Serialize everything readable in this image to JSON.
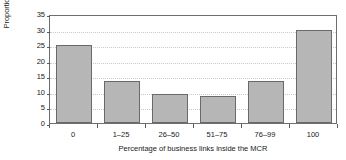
{
  "chart_data": {
    "type": "bar",
    "title": "",
    "xlabel": "Percentage of business links inside the MCR",
    "ylabel": "Proportion of sample (%)",
    "categories": [
      "0",
      "1–25",
      "26–50",
      "51–75",
      "76–99",
      "100"
    ],
    "values": [
      25,
      13.4,
      9.2,
      8.6,
      13.4,
      30
    ],
    "ylim": [
      0,
      35
    ],
    "yticks": [
      0,
      5,
      10,
      15,
      20,
      25,
      30,
      35
    ],
    "ytick_labels": [
      "0",
      "5",
      "10",
      "15",
      "20",
      "25",
      "30",
      "35"
    ],
    "grid": true,
    "grid_axis": "y",
    "grid_style": "dotted",
    "legend": false,
    "legend_position": "none",
    "bar_color": "#b6b6b6",
    "bar_edge_color": "#6a6a6a",
    "axis_color": "#6e6e6e",
    "grid_color": "#c9c9c9",
    "background": "#ffffff"
  }
}
